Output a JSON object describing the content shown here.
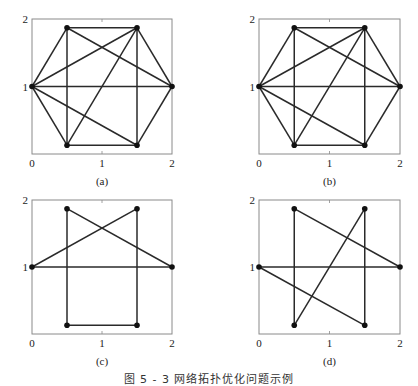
{
  "caption": "图 5 - 3   网络拓扑优化问题示例",
  "colors": {
    "edge": "#2a2a2a",
    "node": "#111111",
    "frame": "#8a8a8a",
    "text": "#222222"
  },
  "chart_data": [
    {
      "type": "scatter",
      "title": "(a)",
      "xlim": [
        0,
        2
      ],
      "ylim": [
        0,
        2
      ],
      "xticks": [
        "0",
        "1",
        "2"
      ],
      "yticks": [
        "1",
        "2"
      ],
      "grid": false,
      "nodes": {
        "A": [
          0,
          1
        ],
        "B": [
          0.5,
          1.87
        ],
        "C": [
          1.5,
          1.87
        ],
        "D": [
          2,
          1
        ],
        "E": [
          1.5,
          0.13
        ],
        "F": [
          0.5,
          0.13
        ]
      },
      "edges": [
        [
          "A",
          "B"
        ],
        [
          "B",
          "C"
        ],
        [
          "C",
          "D"
        ],
        [
          "D",
          "E"
        ],
        [
          "E",
          "F"
        ],
        [
          "F",
          "A"
        ],
        [
          "A",
          "D"
        ],
        [
          "B",
          "F"
        ],
        [
          "C",
          "E"
        ],
        [
          "A",
          "C"
        ],
        [
          "B",
          "D"
        ],
        [
          "C",
          "F"
        ],
        [
          "A",
          "E"
        ]
      ]
    },
    {
      "type": "scatter",
      "title": "(b)",
      "xlim": [
        0,
        2
      ],
      "ylim": [
        0,
        2
      ],
      "xticks": [
        "0",
        "1",
        "2"
      ],
      "yticks": [
        "1",
        "2"
      ],
      "grid": false,
      "nodes": {
        "A": [
          0,
          1
        ],
        "B": [
          0.5,
          1.87
        ],
        "C": [
          1.5,
          1.87
        ],
        "D": [
          2,
          1
        ],
        "E": [
          1.5,
          0.13
        ],
        "F": [
          0.5,
          0.13
        ]
      },
      "edges": [
        [
          "A",
          "B"
        ],
        [
          "B",
          "C"
        ],
        [
          "C",
          "D"
        ],
        [
          "D",
          "E"
        ],
        [
          "E",
          "F"
        ],
        [
          "F",
          "A"
        ],
        [
          "A",
          "D"
        ],
        [
          "B",
          "F"
        ],
        [
          "C",
          "E"
        ],
        [
          "A",
          "C"
        ],
        [
          "B",
          "D"
        ],
        [
          "C",
          "F"
        ],
        [
          "A",
          "E"
        ]
      ]
    },
    {
      "type": "scatter",
      "title": "(c)",
      "xlim": [
        0,
        2
      ],
      "ylim": [
        0,
        2
      ],
      "xticks": [
        "0",
        "1",
        "2"
      ],
      "yticks": [
        "1",
        "2"
      ],
      "grid": false,
      "nodes": {
        "A": [
          0,
          1
        ],
        "B": [
          0.5,
          1.87
        ],
        "C": [
          1.5,
          1.87
        ],
        "D": [
          2,
          1
        ],
        "E": [
          1.5,
          0.13
        ],
        "F": [
          0.5,
          0.13
        ]
      },
      "edges": [
        [
          "A",
          "C"
        ],
        [
          "B",
          "D"
        ],
        [
          "A",
          "D"
        ],
        [
          "B",
          "F"
        ],
        [
          "C",
          "E"
        ],
        [
          "F",
          "E"
        ]
      ]
    },
    {
      "type": "scatter",
      "title": "(d)",
      "xlim": [
        0,
        2
      ],
      "ylim": [
        0,
        2
      ],
      "xticks": [
        "0",
        "1",
        "2"
      ],
      "yticks": [
        "1",
        "2"
      ],
      "grid": false,
      "nodes": {
        "A": [
          0,
          1
        ],
        "B": [
          0.5,
          1.87
        ],
        "C": [
          1.5,
          1.87
        ],
        "D": [
          2,
          1
        ],
        "E": [
          1.5,
          0.13
        ],
        "F": [
          0.5,
          0.13
        ]
      },
      "edges": [
        [
          "B",
          "F"
        ],
        [
          "C",
          "F"
        ],
        [
          "C",
          "E"
        ],
        [
          "B",
          "D"
        ],
        [
          "A",
          "D"
        ],
        [
          "A",
          "E"
        ]
      ]
    }
  ],
  "layout": [
    {
      "x0": 32,
      "x1": 172,
      "y0": 19,
      "y1": 154
    },
    {
      "x0": 259,
      "x1": 400,
      "y0": 19,
      "y1": 154
    },
    {
      "x0": 32,
      "x1": 172,
      "y0": 200,
      "y1": 334
    },
    {
      "x0": 259,
      "x1": 400,
      "y0": 200,
      "y1": 334
    }
  ]
}
